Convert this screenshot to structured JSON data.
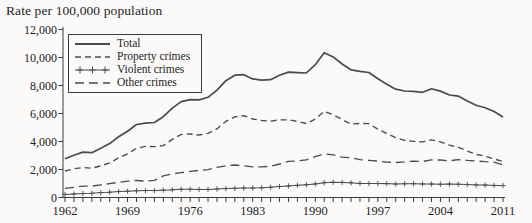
{
  "figure": {
    "title": "Rate per 100,000 population"
  },
  "chart_data": {
    "type": "line",
    "title": "Rate per 100,000 population",
    "xlabel": "",
    "ylabel": "Rate per 100,000 population",
    "x_start": 1962,
    "x_end": 2011,
    "x_tick_labels": [
      1962,
      1969,
      1976,
      1983,
      1990,
      1997,
      2004,
      2011
    ],
    "ylim": [
      0,
      12000
    ],
    "y_ticks": [
      0,
      2000,
      4000,
      6000,
      8000,
      10000,
      12000
    ],
    "grid": false,
    "legend_position": "top-left-inside",
    "line_color": "#4b4b4b",
    "series": [
      {
        "name": "Total",
        "line_style": "solid",
        "values": [
          2771,
          3022,
          3245,
          3199,
          3511,
          3850,
          4336,
          4737,
          5212,
          5311,
          5355,
          5773,
          6388,
          6852,
          6984,
          6971,
          7154,
          7666,
          8343,
          8736,
          8773,
          8470,
          8387,
          8413,
          8727,
          8957,
          8920,
          8892,
          9485,
          10342,
          10040,
          9538,
          9125,
          9008,
          8932,
          8475,
          8094,
          7733,
          7607,
          7587,
          7516,
          7772,
          7600,
          7325,
          7245,
          6899,
          6588,
          6406,
          6145,
          5756
        ]
      },
      {
        "name": "Property crimes",
        "line_style": "dash-medium",
        "values": [
          1891,
          2047,
          2146,
          2091,
          2258,
          2477,
          2826,
          3120,
          3515,
          3649,
          3634,
          3704,
          4151,
          4498,
          4533,
          4466,
          4579,
          4903,
          5444,
          5759,
          5840,
          5608,
          5501,
          5451,
          5550,
          5553,
          5439,
          5289,
          5593,
          6160,
          5904,
          5575,
          5240,
          5292,
          5274,
          4880,
          4569,
          4276,
          4081,
          4004,
          3973,
          4121,
          3977,
          3743,
          3588,
          3320,
          3079,
          2960,
          2752,
          2577
        ]
      },
      {
        "name": "Violent crimes",
        "line_style": "solid-plus",
        "values": [
          221,
          249,
          284,
          299,
          347,
          381,
          423,
          452,
          481,
          492,
          497,
          524,
          553,
          585,
          584,
          572,
          580,
          610,
          636,
          654,
          671,
          679,
          701,
          735,
          785,
          829,
          868,
          911,
          973,
          1059,
          1084,
          1082,
          1047,
          1009,
          1002,
          993,
          995,
          958,
          984,
          984,
          969,
          963,
          946,
          962,
          951,
          930,
          903,
          887,
          864,
          851
        ]
      },
      {
        "name": "Other crimes",
        "line_style": "dash-long",
        "values": [
          659,
          726,
          815,
          809,
          906,
          992,
          1087,
          1165,
          1216,
          1170,
          1224,
          1545,
          1684,
          1769,
          1867,
          1933,
          1995,
          2153,
          2263,
          2323,
          2262,
          2183,
          2185,
          2227,
          2392,
          2575,
          2613,
          2692,
          2919,
          3123,
          3052,
          2881,
          2838,
          2707,
          2656,
          2602,
          2530,
          2499,
          2542,
          2599,
          2574,
          2688,
          2677,
          2620,
          2706,
          2649,
          2606,
          2559,
          2529,
          2328
        ]
      }
    ]
  }
}
